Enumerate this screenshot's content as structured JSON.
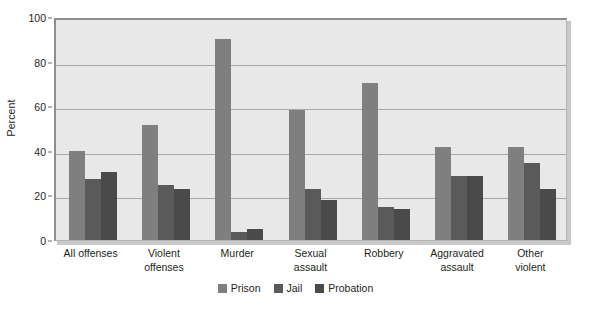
{
  "chart_data": {
    "type": "bar",
    "title": "",
    "xlabel": "",
    "ylabel": "Percent",
    "ylim": [
      0,
      100
    ],
    "yticks": [
      0,
      20,
      40,
      60,
      80,
      100
    ],
    "ytick_labels": [
      "0",
      "20",
      "40",
      "60",
      "80",
      "100"
    ],
    "grid": true,
    "legend_position": "bottom-center",
    "categories": [
      "All offenses",
      "Violent offenses",
      "Murder",
      "Sexual assault",
      "Robbery",
      "Aggravated assault",
      "Other violent"
    ],
    "category_lines": [
      [
        "All offenses"
      ],
      [
        "Violent",
        "offenses"
      ],
      [
        "Murder"
      ],
      [
        "Sexual",
        "assault"
      ],
      [
        "Robbery"
      ],
      [
        "Aggravated",
        "assault"
      ],
      [
        "Other",
        "violent"
      ]
    ],
    "series": [
      {
        "name": "Prison",
        "color": "#7f7f7f",
        "values": [
          40.0,
          51.5,
          90.0,
          58.5,
          70.5,
          41.5,
          41.5
        ]
      },
      {
        "name": "Jail",
        "color": "#5a5a5a",
        "values": [
          27.5,
          24.8,
          3.5,
          22.7,
          14.8,
          28.5,
          34.5
        ]
      },
      {
        "name": "Probation",
        "color": "#4a4a4a",
        "values": [
          30.5,
          22.7,
          4.8,
          18.0,
          14.0,
          28.5,
          23.0
        ]
      }
    ],
    "colors": {
      "plot_background": "#e8e8e8",
      "page_background": "#ffffff",
      "grid_line": "#a8a8a8",
      "axis_line": "#8d8d8d",
      "text": "#231f20"
    }
  }
}
